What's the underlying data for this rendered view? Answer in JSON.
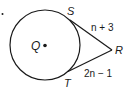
{
  "diagram": {
    "type": "circle-tangent-segments",
    "problem_marker": ".",
    "center": {
      "label": "Q",
      "x": 44,
      "y": 45
    },
    "circle": {
      "cx": 45,
      "cy": 45,
      "r": 35
    },
    "points": {
      "S": {
        "label": "S",
        "x": 70,
        "y": 20
      },
      "T": {
        "label": "T",
        "x": 68,
        "y": 71
      },
      "R": {
        "label": "R",
        "x": 112,
        "y": 50
      }
    },
    "segments": [
      {
        "name": "SR",
        "label": "n + 3"
      },
      {
        "name": "TR",
        "label": "2n − 1"
      }
    ],
    "colors": {
      "stroke": "#1a1a1a",
      "background": "#ffffff"
    }
  }
}
